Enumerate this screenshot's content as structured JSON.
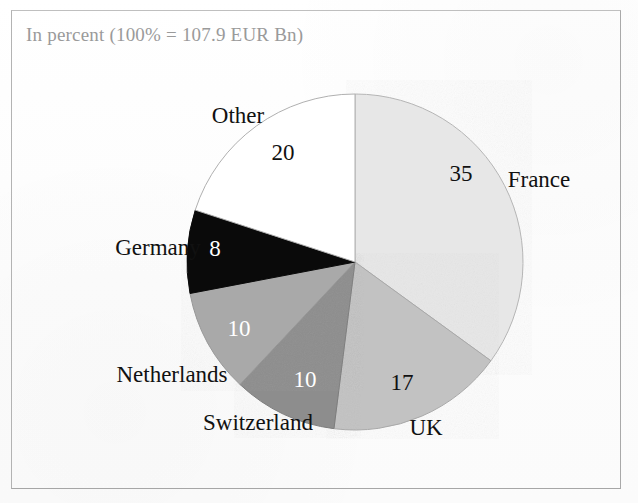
{
  "figure": {
    "subtitle": "In percent (100% = 107.9 EUR Bn)",
    "frame_color": "#b9b9b9",
    "subtitle_color": "#9a9a9a",
    "background_color": "#fdfdfd"
  },
  "chart_data": {
    "type": "pie",
    "title": "",
    "subtitle": "In percent (100% = 107.9 EUR Bn)",
    "total_label": "100% = 107.9 EUR Bn",
    "total_value": 107.9,
    "units": "EUR Bn",
    "value_units": "percent",
    "xlabel": "",
    "ylabel": "",
    "grid": false,
    "legend": "none",
    "labels_position": "outside-with-values-inside",
    "start_angle_deg": 0,
    "direction": "clockwise",
    "categories": [
      "France",
      "UK",
      "Switzerland",
      "Netherlands",
      "Germany",
      "Other"
    ],
    "values": [
      35,
      17,
      10,
      10,
      8,
      20
    ],
    "colors": [
      "#e7e7e7",
      "#c2c2c2",
      "#8d8d8d",
      "#a9a9a9",
      "#0a0a0a",
      "#ffffff"
    ],
    "slices": [
      {
        "name": "France",
        "value": 35,
        "value_text": "35",
        "color": "#e7e7e7",
        "value_text_color": "#111111"
      },
      {
        "name": "UK",
        "value": 17,
        "value_text": "17",
        "color": "#c2c2c2",
        "value_text_color": "#111111"
      },
      {
        "name": "Switzerland",
        "value": 10,
        "value_text": "10",
        "color": "#8d8d8d",
        "value_text_color": "#ffffff"
      },
      {
        "name": "Netherlands",
        "value": 10,
        "value_text": "10",
        "color": "#a9a9a9",
        "value_text_color": "#ffffff"
      },
      {
        "name": "Germany",
        "value": 8,
        "value_text": "8",
        "color": "#0a0a0a",
        "value_text_color": "#ffffff"
      },
      {
        "name": "Other",
        "value": 20,
        "value_text": "20",
        "color": "#ffffff",
        "value_text_color": "#111111"
      }
    ]
  },
  "labels": {
    "other": "Other",
    "france": "France",
    "uk": "UK",
    "switzerland": "Switzerland",
    "netherlands": "Netherlands",
    "germany": "Germany"
  },
  "values": {
    "other": "20",
    "france": "35",
    "uk": "17",
    "switzerland": "10",
    "netherlands": "10",
    "germany": "8"
  }
}
